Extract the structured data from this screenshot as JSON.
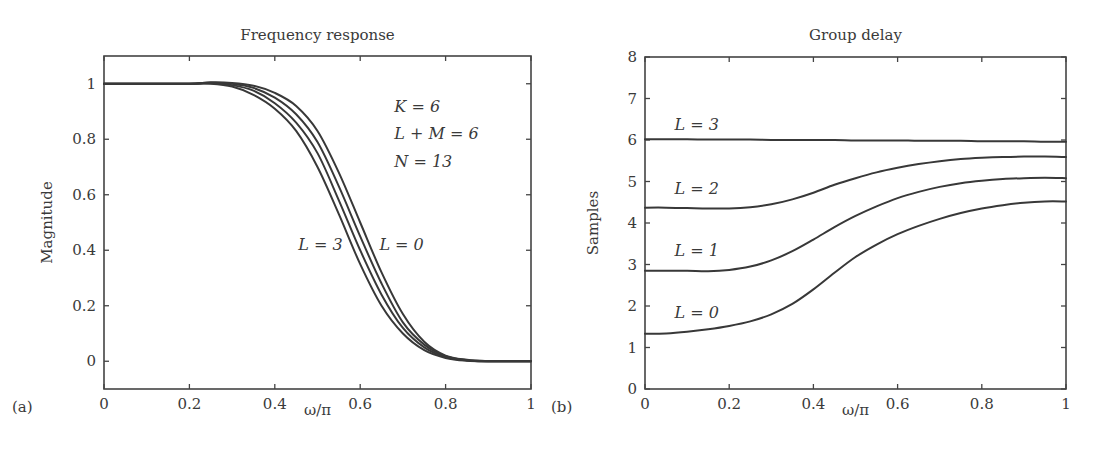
{
  "chart_data": [
    {
      "type": "line",
      "panel_label": "(a)",
      "title": "Frequency response",
      "xlabel": "ω/π",
      "ylabel": "Magnitude",
      "xlim": [
        0,
        1
      ],
      "ylim": [
        -0.1,
        1.1
      ],
      "xticks": [
        0,
        0.2,
        0.4,
        0.6,
        0.8,
        1
      ],
      "xtick_labels": [
        "0",
        "0.2",
        "0.4",
        "0.6",
        "0.8",
        "1"
      ],
      "yticks": [
        0,
        0.2,
        0.4,
        0.6,
        0.8,
        1
      ],
      "ytick_labels": [
        "0",
        "0.2",
        "0.4",
        "0.6",
        "0.8",
        "1"
      ],
      "grid": false,
      "annotations": [
        {
          "text": "K = 6",
          "x": 0.68,
          "y": 0.9
        },
        {
          "text": "L + M = 6",
          "x": 0.68,
          "y": 0.8
        },
        {
          "text": "N = 13",
          "x": 0.68,
          "y": 0.7
        },
        {
          "text": "L = 3",
          "x": 0.455,
          "y": 0.4
        },
        {
          "text": "L = 0",
          "x": 0.645,
          "y": 0.4
        }
      ],
      "x": [
        0,
        0.1,
        0.2,
        0.25,
        0.3,
        0.35,
        0.4,
        0.45,
        0.5,
        0.55,
        0.6,
        0.65,
        0.7,
        0.75,
        0.8,
        0.85,
        0.9,
        0.95,
        1
      ],
      "series": [
        {
          "name": "L = 3",
          "values": [
            1,
            1,
            1,
            1.0,
            0.99,
            0.96,
            0.91,
            0.83,
            0.7,
            0.53,
            0.35,
            0.2,
            0.1,
            0.04,
            0.012,
            0.002,
            0,
            0,
            0
          ]
        },
        {
          "name": "L = 2",
          "values": [
            1,
            1,
            1,
            1.002,
            0.995,
            0.975,
            0.93,
            0.86,
            0.75,
            0.58,
            0.4,
            0.24,
            0.12,
            0.05,
            0.015,
            0.003,
            0,
            0,
            0
          ]
        },
        {
          "name": "L = 1",
          "values": [
            1,
            1,
            1,
            1.004,
            1.0,
            0.985,
            0.95,
            0.89,
            0.79,
            0.63,
            0.45,
            0.28,
            0.14,
            0.06,
            0.018,
            0.004,
            0,
            0,
            0
          ]
        },
        {
          "name": "L = 0",
          "values": [
            1,
            1,
            1,
            1.005,
            1.003,
            0.993,
            0.967,
            0.92,
            0.83,
            0.68,
            0.5,
            0.32,
            0.17,
            0.07,
            0.02,
            0.005,
            0,
            0,
            0
          ]
        }
      ]
    },
    {
      "type": "line",
      "panel_label": "(b)",
      "title": "Group delay",
      "xlabel": "ω/π",
      "ylabel": "Samples",
      "xlim": [
        0,
        1
      ],
      "ylim": [
        0,
        8
      ],
      "xticks": [
        0,
        0.2,
        0.4,
        0.6,
        0.8,
        1
      ],
      "xtick_labels": [
        "0",
        "0.2",
        "0.4",
        "0.6",
        "0.8",
        "1"
      ],
      "yticks": [
        0,
        1,
        2,
        3,
        4,
        5,
        6,
        7,
        8
      ],
      "ytick_labels": [
        "0",
        "1",
        "2",
        "3",
        "4",
        "5",
        "6",
        "7",
        "8"
      ],
      "grid": false,
      "annotations": [
        {
          "text": "L = 3",
          "x": 0.07,
          "y": 6.25
        },
        {
          "text": "L = 2",
          "x": 0.07,
          "y": 4.7
        },
        {
          "text": "L = 1",
          "x": 0.07,
          "y": 3.2
        },
        {
          "text": "L = 0",
          "x": 0.07,
          "y": 1.7
        }
      ],
      "x": [
        0,
        0.05,
        0.1,
        0.15,
        0.2,
        0.25,
        0.3,
        0.35,
        0.4,
        0.45,
        0.5,
        0.55,
        0.6,
        0.65,
        0.7,
        0.75,
        0.8,
        0.85,
        0.9,
        0.95,
        1
      ],
      "series": [
        {
          "name": "L = 3",
          "values": [
            6.02,
            6.02,
            6.02,
            6.01,
            6.01,
            6.01,
            6.0,
            6.0,
            6.0,
            6.0,
            5.99,
            5.99,
            5.99,
            5.98,
            5.98,
            5.98,
            5.97,
            5.97,
            5.97,
            5.96,
            5.96
          ]
        },
        {
          "name": "L = 2",
          "values": [
            4.37,
            4.37,
            4.36,
            4.35,
            4.35,
            4.38,
            4.45,
            4.57,
            4.73,
            4.92,
            5.08,
            5.22,
            5.33,
            5.42,
            5.49,
            5.54,
            5.57,
            5.59,
            5.6,
            5.6,
            5.59
          ]
        },
        {
          "name": "L = 1",
          "values": [
            2.85,
            2.85,
            2.85,
            2.84,
            2.87,
            2.95,
            3.1,
            3.32,
            3.6,
            3.9,
            4.17,
            4.4,
            4.6,
            4.75,
            4.87,
            4.96,
            5.02,
            5.06,
            5.08,
            5.09,
            5.08
          ]
        },
        {
          "name": "L = 0",
          "values": [
            1.33,
            1.34,
            1.38,
            1.44,
            1.52,
            1.63,
            1.8,
            2.05,
            2.4,
            2.8,
            3.18,
            3.48,
            3.73,
            3.93,
            4.1,
            4.24,
            4.35,
            4.43,
            4.49,
            4.52,
            4.52
          ]
        }
      ]
    }
  ]
}
